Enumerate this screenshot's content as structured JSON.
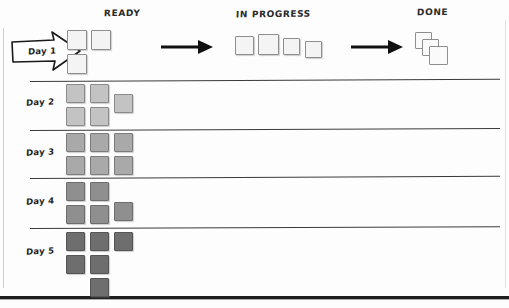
{
  "diagram": {
    "title_columns": [
      {
        "id": "ready",
        "label": "READY"
      },
      {
        "id": "in_progress",
        "label": "IN PROGRESS"
      },
      {
        "id": "done",
        "label": "DONE"
      }
    ],
    "style": {
      "background": "#fdfdfd",
      "line_color": "#3a3a3a",
      "border_color": "#8e8e8e",
      "bottom_border_color": "#1e1e1e",
      "arrow_color": "#111111"
    },
    "header_row": {
      "day_label": "Day 1",
      "arrow_name": "day-1-arrow",
      "ready_cards": 3,
      "in_progress_cards": 4,
      "done_cards": 3,
      "card_fill": "#f4f4f4"
    },
    "rows": [
      {
        "id": "day1",
        "label": "Day 1",
        "card_count": 3,
        "card_fill": "#f4f4f4",
        "card_border": "#8e8e8e",
        "cards": [
          {
            "col": 0,
            "row": 0
          },
          {
            "col": 1,
            "row": 0
          },
          {
            "col": 0,
            "row": 1
          }
        ]
      },
      {
        "id": "day2",
        "label": "Day 2",
        "card_count": 5,
        "card_fill": "#c3c3c3",
        "card_border": "#8a8a8a",
        "cards": [
          {
            "col": 0,
            "row": 0
          },
          {
            "col": 1,
            "row": 0
          },
          {
            "col": 2,
            "row": 0.45
          },
          {
            "col": 0,
            "row": 1
          },
          {
            "col": 1,
            "row": 1
          }
        ]
      },
      {
        "id": "day3",
        "label": "Day 3",
        "card_count": 6,
        "card_fill": "#a9a9a9",
        "card_border": "#7c7c7c",
        "cards": [
          {
            "col": 0,
            "row": 0
          },
          {
            "col": 1,
            "row": 0
          },
          {
            "col": 2,
            "row": 0
          },
          {
            "col": 0,
            "row": 1
          },
          {
            "col": 1,
            "row": 1
          },
          {
            "col": 2,
            "row": 1
          }
        ]
      },
      {
        "id": "day4",
        "label": "Day 4",
        "card_count": 5,
        "card_fill": "#8f8f8f",
        "card_border": "#6d6d6d",
        "cards": [
          {
            "col": 0,
            "row": 0
          },
          {
            "col": 1,
            "row": 0
          },
          {
            "col": 0,
            "row": 1
          },
          {
            "col": 1,
            "row": 1
          },
          {
            "col": 2,
            "row": 0.85
          }
        ]
      },
      {
        "id": "day5",
        "label": "Day 5",
        "card_count": 6,
        "card_fill": "#6e6e6e",
        "card_border": "#555555",
        "cards": [
          {
            "col": 0,
            "row": 0
          },
          {
            "col": 1,
            "row": 0
          },
          {
            "col": 2,
            "row": 0
          },
          {
            "col": 0,
            "row": 1
          },
          {
            "col": 1,
            "row": 1
          },
          {
            "col": 1,
            "row": 2
          }
        ]
      }
    ],
    "flow_arrows": [
      {
        "id": "arrow-ready-to-inprogress",
        "name": "flow-arrow-1"
      },
      {
        "id": "arrow-inprogress-to-done",
        "name": "flow-arrow-2"
      }
    ]
  }
}
